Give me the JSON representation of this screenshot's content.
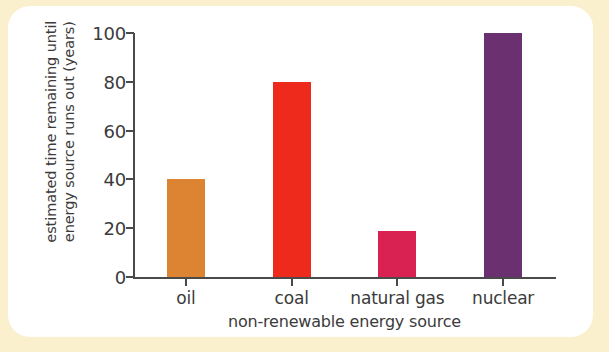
{
  "figure": {
    "background_color": "#faf0ce",
    "card_color": "#ffffff",
    "axis_color": "#4a4a4a",
    "text_color": "#3b3b3b"
  },
  "chart_data": {
    "type": "bar",
    "title": "",
    "subtitle": "",
    "xlabel": "non-renewable energy source",
    "ylabel_lines": [
      "estimated time remaining until",
      "energy source runs out (years)"
    ],
    "ylabel": "estimated time remaining until energy source runs out (years)",
    "categories": [
      "oil",
      "coal",
      "natural gas",
      "nuclear"
    ],
    "values": [
      40,
      80,
      19,
      100
    ],
    "colors": [
      "#dd8433",
      "#ee2a1c",
      "#d92252",
      "#6a3070"
    ],
    "ylim": [
      0,
      100
    ],
    "yticks": [
      0,
      20,
      40,
      60,
      80,
      100
    ],
    "ytick_labels": [
      "0",
      "20",
      "40",
      "60",
      "80",
      "100"
    ],
    "grid": false,
    "legend": false,
    "legend_position": "none"
  }
}
